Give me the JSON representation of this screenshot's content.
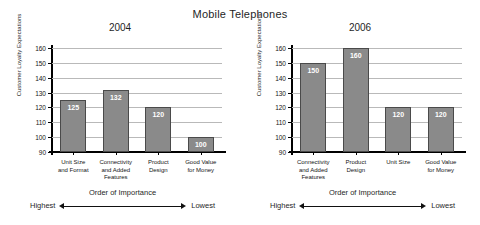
{
  "main_title": "Mobile Telephones",
  "axis": {
    "y_label": "Customer Loyalty Expectations",
    "y_ticks": [
      160,
      150,
      140,
      130,
      120,
      110,
      100,
      90
    ],
    "y_min": 90,
    "y_max": 160
  },
  "importance": {
    "title": "Order of Importance",
    "highest": "Highest",
    "lowest": "Lowest"
  },
  "colors": {
    "bar_fill": "#8a8a8a",
    "bar_stroke": "#4a4a4a",
    "gridline": "#b9b9b9",
    "axis": "#000000",
    "value_label": "#ffffff"
  },
  "chart_data": [
    {
      "type": "bar",
      "title": "2004",
      "xlabel": "Order of Importance",
      "ylabel": "Customer Loyalty Expectations",
      "ylim": [
        90,
        160
      ],
      "yticks": [
        90,
        100,
        110,
        120,
        130,
        140,
        150,
        160
      ],
      "grid": true,
      "legend": "none",
      "categories": [
        "Unit Size\nand Format",
        "Connectivity\nand Added\nFeatures",
        "Product\nDesign",
        "Good Value\nfor Money"
      ],
      "values": [
        125,
        132,
        120,
        100
      ],
      "data_labels": [
        "125",
        "132",
        "120",
        "100"
      ]
    },
    {
      "type": "bar",
      "title": "2006",
      "xlabel": "Order of Importance",
      "ylabel": "Customer Loyalty Expectations",
      "ylim": [
        90,
        160
      ],
      "yticks": [
        90,
        100,
        110,
        120,
        130,
        140,
        150,
        160
      ],
      "grid": true,
      "legend": "none",
      "categories": [
        "Connectivity\nand Added\nFeatures",
        "Product\nDesign",
        "Unit Size",
        "Good Value\nfor Money"
      ],
      "values": [
        150,
        160,
        120,
        120
      ],
      "data_labels": [
        "150",
        "160",
        "120",
        "120"
      ]
    }
  ]
}
